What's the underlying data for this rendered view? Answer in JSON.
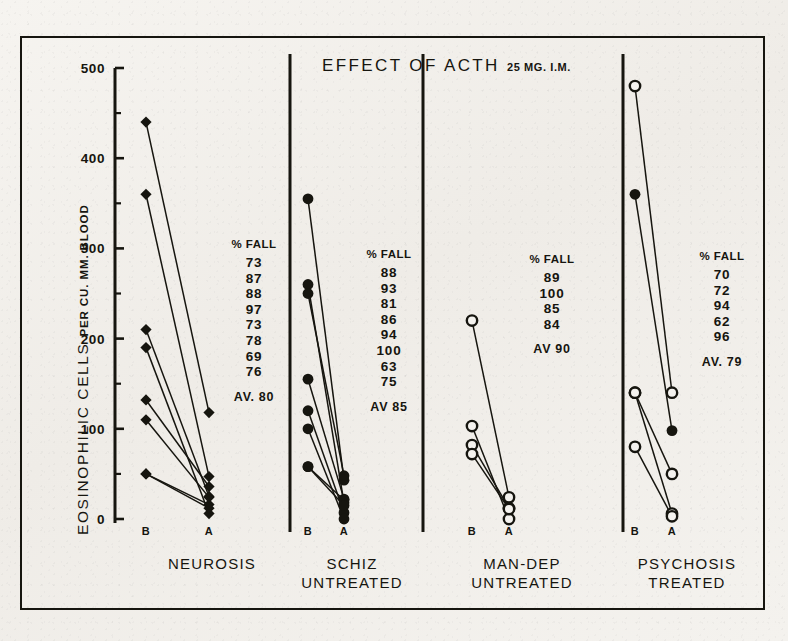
{
  "figure": {
    "title": "EFFECT OF ACTH",
    "title_sub": "25 MG. I.M.",
    "ylabel_main": "EOSINOPHILIC CELLS",
    "ylabel_sub": "PER CU. MM. BLOOD"
  },
  "axis": {
    "y_ticks_labeled": [
      "500",
      "400",
      "300",
      "200",
      "100",
      "0"
    ],
    "y_min": 0,
    "y_max": 500,
    "minor_tick_step": 50
  },
  "panels": [
    {
      "name": "NEUROSIS",
      "label_line1": "NEUROSIS",
      "label_line2": "",
      "x_labels": [
        "B",
        "A"
      ],
      "fall_header": "% FALL",
      "fall_values": [
        "73",
        "87",
        "88",
        "97",
        "73",
        "78",
        "69",
        "76"
      ],
      "average": "AV. 80"
    },
    {
      "name": "SCHIZ UNTREATED",
      "label_line1": "SCHIZ",
      "label_line2": "UNTREATED",
      "x_labels": [
        "B",
        "A"
      ],
      "fall_header": "% FALL",
      "fall_values": [
        "88",
        "93",
        "81",
        "86",
        "94",
        "100",
        "63",
        "75"
      ],
      "average": "AV 85"
    },
    {
      "name": "MAN-DEP UNTREATED",
      "label_line1": "MAN-DEP",
      "label_line2": "UNTREATED",
      "x_labels": [
        "B",
        "A"
      ],
      "fall_header": "% FALL",
      "fall_values": [
        "89",
        "100",
        "85",
        "84"
      ],
      "average": "AV 90"
    },
    {
      "name": "PSYCHOSIS TREATED",
      "label_line1": "PSYCHOSIS",
      "label_line2": "TREATED",
      "x_labels": [
        "B",
        "A"
      ],
      "fall_header": "% FALL",
      "fall_values": [
        "70",
        "72",
        "94",
        "62",
        "96"
      ],
      "average": "AV. 79"
    }
  ],
  "chart_data": {
    "type": "line",
    "title": "EFFECT OF ACTH 25 MG. I.M.",
    "xlabel": "",
    "ylabel": "EOSINOPHILIC CELLS PER CU. MM. BLOOD",
    "ylim": [
      0,
      500
    ],
    "grid": false,
    "legend": "none",
    "categories": [
      "B",
      "A"
    ],
    "panels": [
      {
        "name": "NEUROSIS",
        "marker": "filled-diamond",
        "subjects": [
          {
            "B": 440,
            "A": 118,
            "pct_fall": 73,
            "marker": "filled"
          },
          {
            "B": 360,
            "A": 47,
            "pct_fall": 87,
            "marker": "filled"
          },
          {
            "B": 210,
            "A": 25,
            "pct_fall": 88,
            "marker": "filled"
          },
          {
            "B": 190,
            "A": 6,
            "pct_fall": 97,
            "marker": "filled"
          },
          {
            "B": 132,
            "A": 36,
            "pct_fall": 73,
            "marker": "filled"
          },
          {
            "B": 110,
            "A": 24,
            "pct_fall": 78,
            "marker": "filled"
          },
          {
            "B": 50,
            "A": 16,
            "pct_fall": 69,
            "marker": "filled"
          },
          {
            "B": 50,
            "A": 12,
            "pct_fall": 76,
            "marker": "filled"
          }
        ],
        "average_pct_fall": 80
      },
      {
        "name": "SCHIZ UNTREATED",
        "marker": "filled-circle",
        "subjects": [
          {
            "B": 355,
            "A": 43,
            "pct_fall": 88,
            "marker": "filled"
          },
          {
            "B": 260,
            "A": 18,
            "pct_fall": 93,
            "marker": "filled"
          },
          {
            "B": 250,
            "A": 48,
            "pct_fall": 81,
            "marker": "filled"
          },
          {
            "B": 155,
            "A": 22,
            "pct_fall": 86,
            "marker": "filled"
          },
          {
            "B": 120,
            "A": 7,
            "pct_fall": 94,
            "marker": "filled"
          },
          {
            "B": 100,
            "A": 0,
            "pct_fall": 100,
            "marker": "filled"
          },
          {
            "B": 58,
            "A": 21,
            "pct_fall": 63,
            "marker": "filled"
          },
          {
            "B": 58,
            "A": 15,
            "pct_fall": 75,
            "marker": "filled"
          }
        ],
        "average_pct_fall": 85
      },
      {
        "name": "MAN-DEP UNTREATED",
        "marker": "open-circle",
        "subjects": [
          {
            "B": 220,
            "A": 24,
            "pct_fall": 89,
            "marker": "open"
          },
          {
            "B": 103,
            "A": 0,
            "pct_fall": 100,
            "marker": "open"
          },
          {
            "B": 82,
            "A": 12,
            "pct_fall": 85,
            "marker": "open"
          },
          {
            "B": 72,
            "A": 11,
            "pct_fall": 84,
            "marker": "open"
          }
        ],
        "average_pct_fall": 90
      },
      {
        "name": "PSYCHOSIS TREATED",
        "marker": "mixed",
        "subjects": [
          {
            "B": 480,
            "A": 140,
            "pct_fall": 70,
            "marker": "open"
          },
          {
            "B": 360,
            "A": 98,
            "pct_fall": 72,
            "marker": "filled"
          },
          {
            "B": 140,
            "A": 6,
            "pct_fall": 94,
            "marker": "open"
          },
          {
            "B": 140,
            "A": 50,
            "pct_fall": 62,
            "marker": "open"
          },
          {
            "B": 80,
            "A": 3,
            "pct_fall": 96,
            "marker": "open"
          }
        ],
        "average_pct_fall": 79
      }
    ]
  }
}
